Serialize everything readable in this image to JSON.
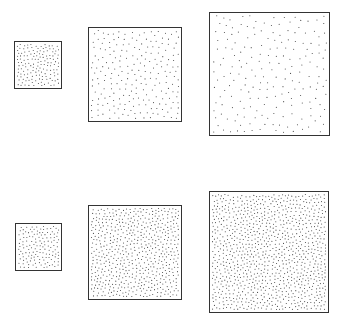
{
  "figure": {
    "border_color": "#333333",
    "dot_color": "#444444",
    "background": "#ffffff",
    "rows": [
      {
        "name": "top-row",
        "panels": [
          {
            "x": 14,
            "y": 41,
            "w": 48,
            "h": 48,
            "dots": 150,
            "min_dist": 3.0,
            "dot_r": 0.55,
            "seed": 11
          },
          {
            "x": 88,
            "y": 27,
            "w": 94,
            "h": 95,
            "dots": 230,
            "min_dist": 5.0,
            "dot_r": 0.55,
            "seed": 23
          },
          {
            "x": 209,
            "y": 12,
            "w": 121,
            "h": 124,
            "dots": 200,
            "min_dist": 6.5,
            "dot_r": 0.55,
            "seed": 37
          }
        ]
      },
      {
        "name": "bottom-row",
        "panels": [
          {
            "x": 15,
            "y": 223,
            "w": 47,
            "h": 48,
            "dots": 150,
            "min_dist": 3.0,
            "dot_r": 0.55,
            "seed": 41
          },
          {
            "x": 88,
            "y": 205,
            "w": 94,
            "h": 95,
            "dots": 600,
            "min_dist": 3.0,
            "dot_r": 0.55,
            "seed": 53
          },
          {
            "x": 209,
            "y": 191,
            "w": 120,
            "h": 122,
            "dots": 1000,
            "min_dist": 3.0,
            "dot_r": 0.55,
            "seed": 67
          }
        ]
      }
    ]
  }
}
